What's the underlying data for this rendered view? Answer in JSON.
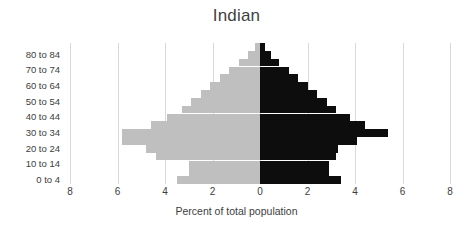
{
  "chart": {
    "title": "Indian",
    "xlabel": "Percent of total population",
    "ylabel": ""
  },
  "axis": {
    "x_ticks": [
      "8",
      "6",
      "4",
      "2",
      "0",
      "2",
      "4",
      "6",
      "8"
    ],
    "x_tick_values": [
      -8,
      -6,
      -4,
      -2,
      0,
      2,
      4,
      6,
      8
    ],
    "y_visible_labels": [
      "80 to 84",
      "70 to 74",
      "60 to 64",
      "50 to 54",
      "40 to 44",
      "30 to 34",
      "20 to 24",
      "10 to 14",
      "0 to 4"
    ]
  },
  "colors": {
    "left_series": "#bfbfbf",
    "right_series": "#0d0d0d",
    "gridline": "#d9d9d9",
    "text": "#3d3d3d",
    "background": "#ffffff"
  },
  "chart_data": {
    "type": "bar",
    "subtype": "population-pyramid",
    "title": "Indian",
    "xlabel": "Percent of total population",
    "ylabel": "",
    "xlim": [
      -8,
      8
    ],
    "grid": true,
    "legend": "none",
    "orientation": "horizontal",
    "categories": [
      "0 to 4",
      "5 to 9",
      "10 to 14",
      "15 to 19",
      "20 to 24",
      "25 to 29",
      "30 to 34",
      "35 to 39",
      "40 to 44",
      "45 to 49",
      "50 to 54",
      "55 to 59",
      "60 to 64",
      "65 to 69",
      "70 to 74",
      "75 to 79",
      "80 to 84",
      "85 and over"
    ],
    "series": [
      {
        "name": "left",
        "color": "#bfbfbf",
        "direction": "left",
        "values": [
          3.5,
          3.0,
          3.0,
          4.4,
          4.8,
          5.8,
          5.8,
          4.6,
          3.9,
          3.3,
          2.9,
          2.5,
          2.1,
          1.7,
          1.3,
          0.9,
          0.5,
          0.2
        ]
      },
      {
        "name": "right",
        "color": "#0d0d0d",
        "direction": "right",
        "values": [
          3.4,
          2.9,
          2.9,
          3.2,
          3.3,
          4.1,
          5.4,
          4.4,
          3.8,
          3.2,
          2.8,
          2.4,
          2.0,
          1.6,
          1.2,
          0.8,
          0.45,
          0.2
        ]
      }
    ]
  }
}
